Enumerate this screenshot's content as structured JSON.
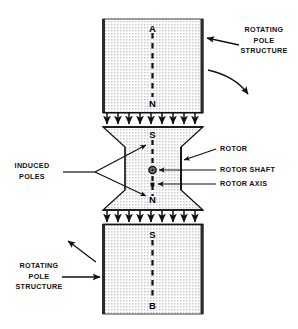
{
  "figure": {
    "background_color": "#ffffff",
    "line_color": "#111111",
    "hatch_fill_color": "#d8d8d8"
  },
  "labels": {
    "rotating_pole_structure_top": "ROTATING\nPOLE\nSTRUCTURE",
    "rotating_pole_structure_bottom": "ROTATING\nPOLE\nSTRUCTURE",
    "induced_poles": "INDUCED\nPOLES",
    "rotor": "ROTOR",
    "rotor_shaft": "ROTOR SHAFT",
    "rotor_axis": "ROTOR AXIS"
  },
  "pole_markers": {
    "top_block_top": "A",
    "top_block_bottom": "N",
    "rotor_top": "S",
    "rotor_bottom": "N",
    "bottom_block_top": "S",
    "bottom_block_bottom": "B"
  },
  "flux_arrows": {
    "upper_row_count": 9,
    "lower_row_count": 9,
    "direction": "down"
  },
  "rotation_arrows": {
    "top_right_direction": "clockwise-down-right",
    "bottom_left_direction": "counterclockwise-up-left"
  }
}
